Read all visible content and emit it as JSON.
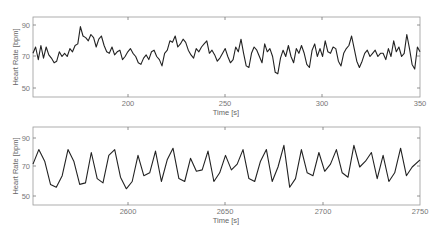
{
  "chart_data": [
    {
      "type": "line",
      "title": "",
      "xlabel": "Time [s]",
      "ylabel": "Heart Rate [bpm]",
      "xlim": [
        151,
        350
      ],
      "ylim": [
        45,
        95
      ],
      "xticks": [
        200,
        250,
        300,
        350
      ],
      "yticks": [
        50,
        70,
        90
      ],
      "grid": false,
      "legend": null,
      "series": [
        {
          "name": "heart_rate_segment_1",
          "color": "#222222",
          "x": [
            151,
            152,
            153,
            154,
            155,
            156,
            157,
            158,
            160,
            162,
            164,
            166,
            168,
            170,
            172,
            174,
            176,
            178,
            180,
            182,
            184,
            186,
            188,
            190,
            192,
            194,
            196,
            198,
            200,
            202,
            204,
            206,
            208,
            210,
            212,
            214,
            216,
            218,
            220,
            222,
            224,
            226,
            228,
            230,
            232,
            234,
            236,
            238,
            240,
            242,
            244,
            246,
            248,
            250,
            252,
            254,
            256,
            258,
            260,
            262,
            264,
            266,
            268,
            270,
            272,
            274,
            276,
            278,
            280,
            282,
            284,
            286,
            288,
            290,
            292,
            294,
            296,
            298,
            300,
            302,
            304,
            306,
            308,
            310,
            312,
            314,
            316,
            318,
            320,
            322,
            324,
            326,
            328,
            330,
            332,
            334,
            336,
            338,
            340,
            342,
            344,
            346,
            348,
            350
          ],
          "y": [
            72,
            76,
            68,
            77,
            69,
            76,
            71,
            69,
            66,
            67,
            73,
            70,
            72,
            70,
            75,
            73,
            77,
            78,
            89,
            83,
            82,
            80,
            84,
            82,
            76,
            81,
            83,
            77,
            73,
            72,
            76,
            71,
            73,
            74,
            68,
            70,
            73,
            75,
            72,
            70,
            66,
            65,
            69,
            71,
            68,
            73,
            74,
            70,
            68,
            64,
            72,
            74,
            80,
            79,
            83,
            76,
            78,
            81,
            79,
            74,
            71,
            69,
            75,
            73,
            76,
            78,
            80,
            72,
            74,
            71,
            67,
            69,
            72,
            75,
            70,
            66,
            68,
            76,
            73,
            81,
            72,
            64,
            63,
            72,
            76,
            74,
            70,
            66,
            78,
            73,
            75,
            70,
            60,
            59,
            69,
            74,
            70,
            77,
            70,
            66,
            75,
            72,
            77,
            72,
            65,
            63,
            74,
            78,
            70,
            75,
            70,
            80,
            73,
            72,
            76,
            75,
            67,
            64,
            72,
            75,
            77,
            83,
            75,
            67,
            63,
            67,
            72,
            74,
            70,
            72,
            74,
            70,
            72,
            72,
            68,
            75,
            70,
            80,
            73,
            76,
            70,
            72,
            84,
            75,
            65,
            62,
            76,
            73
          ],
          "note": "approximate trace read from pixels"
        }
      ]
    },
    {
      "type": "line",
      "title": "",
      "xlabel": "Time [s]",
      "ylabel": "Heart Rate [bpm]",
      "xlim": [
        2551,
        2750
      ],
      "ylim": [
        45,
        95
      ],
      "xticks": [
        2600,
        2650,
        2700,
        2750
      ],
      "yticks": [
        50,
        70,
        90
      ],
      "grid": false,
      "legend": null,
      "series": [
        {
          "name": "heart_rate_segment_2",
          "color": "#222222",
          "x": [
            2551,
            2554,
            2557,
            2560,
            2563,
            2566,
            2569,
            2572,
            2575,
            2578,
            2581,
            2584,
            2587,
            2590,
            2593,
            2596,
            2599,
            2602,
            2605,
            2608,
            2611,
            2614,
            2617,
            2620,
            2623,
            2626,
            2629,
            2632,
            2635,
            2638,
            2641,
            2644,
            2647,
            2650,
            2653,
            2656,
            2659,
            2662,
            2665,
            2668,
            2671,
            2674,
            2677,
            2680,
            2683,
            2686,
            2689,
            2692,
            2695,
            2698,
            2701,
            2704,
            2707,
            2710,
            2713,
            2716,
            2719,
            2722,
            2725,
            2728,
            2731,
            2734,
            2737,
            2740,
            2743,
            2746,
            2750
          ],
          "y": [
            72,
            82,
            74,
            58,
            56,
            64,
            82,
            74,
            58,
            59,
            80,
            62,
            59,
            78,
            82,
            63,
            55,
            60,
            78,
            64,
            66,
            81,
            60,
            75,
            83,
            62,
            60,
            76,
            67,
            68,
            81,
            60,
            66,
            78,
            68,
            72,
            82,
            62,
            60,
            74,
            82,
            60,
            70,
            85,
            56,
            62,
            82,
            66,
            64,
            80,
            67,
            72,
            82,
            66,
            63,
            85,
            70,
            74,
            80,
            62,
            78,
            60,
            66,
            83,
            64,
            70,
            75
          ],
          "note": "approximate trace read from pixels"
        }
      ]
    }
  ],
  "plots": [
    {
      "ylabel": "Heart Rate [bpm]",
      "xlabel": "Time [s]",
      "yticks": [
        "90",
        "70",
        "50"
      ],
      "xticks": [
        "200",
        "250",
        "300",
        "350"
      ]
    },
    {
      "ylabel": "Heart Rate [bpm]",
      "xlabel": "Time [s]",
      "yticks": [
        "90",
        "70",
        "50"
      ],
      "xticks": [
        "2600",
        "2650",
        "2700",
        "2750"
      ]
    }
  ]
}
